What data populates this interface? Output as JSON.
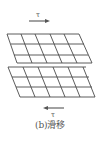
{
  "figure": {
    "caption": "(b)滑移",
    "top_arrow": {
      "label": "τ",
      "direction": "right"
    },
    "bottom_arrow": {
      "label": "τ",
      "direction": "left"
    },
    "upper_block": {
      "rows": 3,
      "cols": 5,
      "description": "upper crystal block displaced right along slip plane"
    },
    "lower_block": {
      "rows": 3,
      "cols": 5,
      "description": "lower crystal block"
    },
    "colors": {
      "line": "#4a4a4a",
      "background": "#ffffff",
      "text": "#555555"
    }
  }
}
